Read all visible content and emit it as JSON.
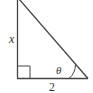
{
  "figure": {
    "type": "right-triangle",
    "labels": {
      "vertical_leg": "x",
      "horizontal_leg": "2",
      "angle": "θ"
    },
    "right_angle_marker": true,
    "colors": {
      "stroke": "#444444",
      "background": "#ffffff"
    }
  }
}
